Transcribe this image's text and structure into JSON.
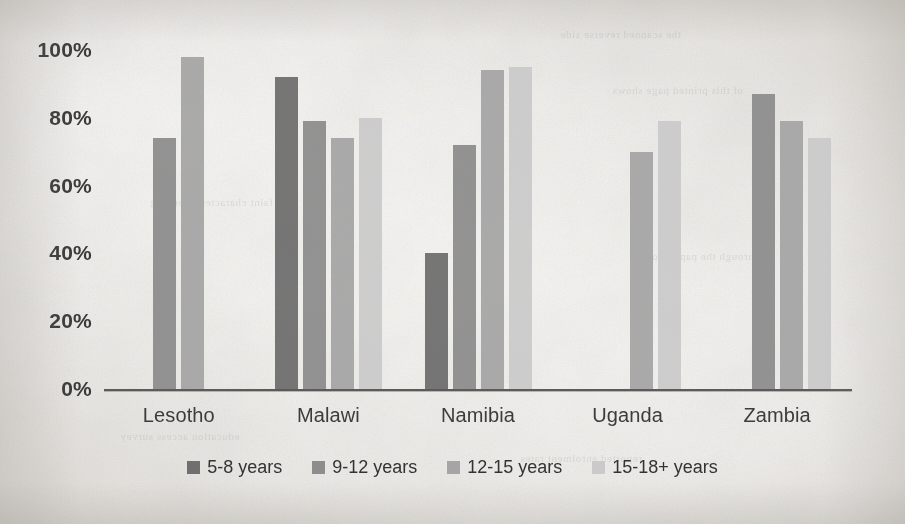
{
  "chart_data": {
    "type": "bar",
    "title": "",
    "subtitle": "",
    "xlabel": "",
    "ylabel": "",
    "categories": [
      "Lesotho",
      "Malawi",
      "Namibia",
      "Uganda",
      "Zambia"
    ],
    "ylim": [
      0,
      100
    ],
    "ytick_labels": [
      "100%",
      "80%",
      "60%",
      "40%",
      "20%",
      "0%"
    ],
    "ytick_values": [
      100,
      80,
      60,
      40,
      20,
      0
    ],
    "grid": false,
    "legend_position": "bottom",
    "value_suffix": "%",
    "series": [
      {
        "name": "5-8 years",
        "color": "#6f6f6f",
        "values": [
          null,
          92,
          40,
          null,
          null
        ]
      },
      {
        "name": "9-12 years",
        "color": "#8d8d8d",
        "values": [
          74,
          79,
          72,
          null,
          87
        ]
      },
      {
        "name": "12-15 years",
        "color": "#a5a5a5",
        "values": [
          98,
          74,
          94,
          70,
          79
        ]
      },
      {
        "name": "15-18+ years",
        "color": "#cacaca",
        "values": [
          null,
          80,
          95,
          79,
          74
        ]
      }
    ]
  },
  "legend": {
    "items": [
      {
        "label": "5-8 years",
        "color": "#6f6f6f"
      },
      {
        "label": "9-12 years",
        "color": "#8d8d8d"
      },
      {
        "label": "12-15 years",
        "color": "#a5a5a5"
      },
      {
        "label": "15-18+ years",
        "color": "#cacaca"
      }
    ]
  },
  "axis": {
    "baseline_color": "#5d5b58"
  },
  "artifacts": {
    "ghost_text": [
      "the scanned reverse side",
      "of this printed page shows",
      "faint characters bleeding",
      "through the paper stock",
      "education access survey",
      "reported enrolment rates"
    ]
  }
}
